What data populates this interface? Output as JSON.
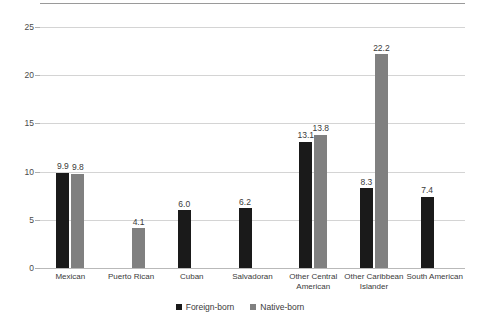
{
  "chart_data": {
    "type": "bar",
    "title": "",
    "xlabel": "",
    "ylabel": "",
    "ylim": [
      0,
      25
    ],
    "yticks": [
      0,
      5,
      10,
      15,
      20,
      25
    ],
    "ytick_labels": [
      "0",
      "5",
      "10",
      "15",
      "20",
      "25"
    ],
    "grid": true,
    "legend_position": "bottom",
    "categories": [
      "Mexican",
      "Puerto Rican",
      "Cuban",
      "Salvadoran",
      "Other Central American",
      "Other Caribbean Islander",
      "South American"
    ],
    "series": [
      {
        "name": "Foreign-born",
        "color": "#1a1a1a",
        "values": [
          9.9,
          null,
          6.0,
          6.2,
          13.1,
          8.3,
          7.4
        ],
        "labels": [
          "9.9",
          "",
          "6.0",
          "6.2",
          "13.1",
          "8.3",
          "7.4"
        ]
      },
      {
        "name": "Native-born",
        "color": "#808080",
        "values": [
          9.8,
          4.1,
          null,
          null,
          13.8,
          22.2,
          null
        ],
        "labels": [
          "9.8",
          "4.1",
          "",
          "",
          "13.8",
          "22.2",
          ""
        ]
      }
    ]
  },
  "legend": {
    "items": [
      {
        "label": "Foreign-born",
        "color": "#1a1a1a"
      },
      {
        "label": "Native-born",
        "color": "#808080"
      }
    ]
  }
}
